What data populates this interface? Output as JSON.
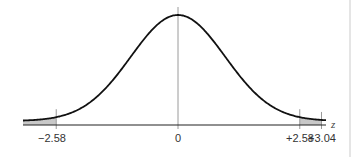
{
  "chart_data": {
    "type": "line",
    "title": "",
    "xlabel": "z",
    "ylabel": "",
    "xlim": [
      -3.3,
      3.2
    ],
    "mean": 0,
    "sd": 1,
    "tick_labels": [
      "-2.58",
      "0",
      "+2.58",
      "+3.04"
    ],
    "tick_values": [
      -2.58,
      0,
      2.58,
      3.04
    ],
    "shaded_regions": [
      {
        "from": -3.3,
        "to": -2.58,
        "label": "left tail"
      },
      {
        "from": 2.58,
        "to": 3.04,
        "label": "right region between +2.58 and +3.04"
      }
    ],
    "grid": false,
    "legend": null
  },
  "axis": {
    "z_label": "z",
    "labels": {
      "neg258": "−2.58",
      "zero": "0",
      "pos258": "+2.58",
      "pos304": "+3.04"
    }
  },
  "colors": {
    "curve": "#111111",
    "axis": "#222222",
    "shade": "#c8c8c8",
    "marker": "#999999",
    "border": "#dddddd"
  }
}
